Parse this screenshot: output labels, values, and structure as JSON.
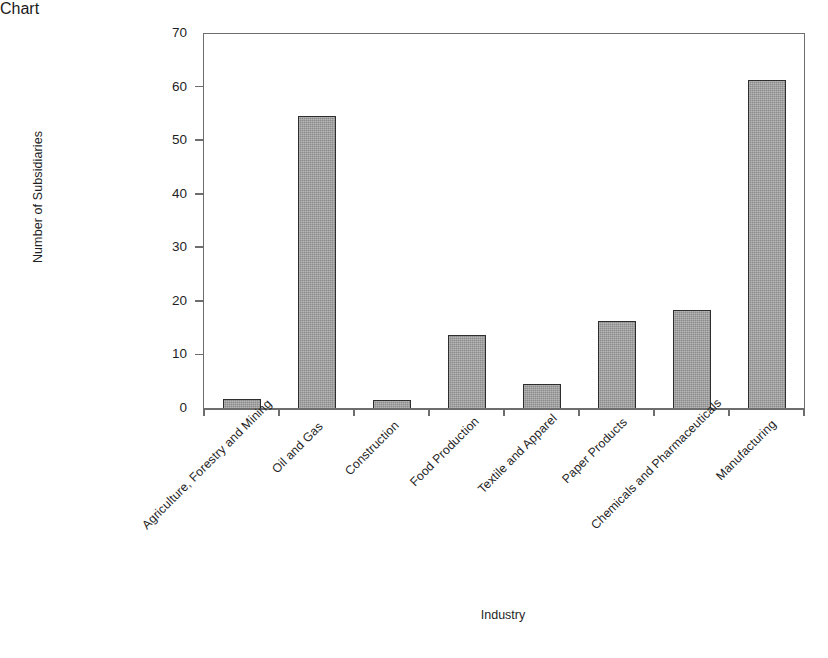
{
  "chart_data": {
    "type": "bar",
    "title": "",
    "xlabel": "Industry",
    "ylabel": "Number of Subsidiaries",
    "ylim": [
      0,
      70
    ],
    "ytick_labels": [
      "70",
      "60",
      "50",
      "40",
      "30",
      "20",
      "10",
      "0"
    ],
    "ytick_values": [
      70,
      60,
      50,
      40,
      30,
      20,
      10,
      0
    ],
    "grid": false,
    "legend": null,
    "bar_color": "#9c9c9c",
    "bar_edge_color": "#2e2e2e",
    "axis_color": "#6d6d6d",
    "categories": [
      "Agriculture, Forestry and Mining",
      "Oil and Gas",
      "Construction",
      "Food Production",
      "Textile and Apparel",
      "Paper Products",
      "Chemicals and Pharmaceuticals",
      "Manufacturing"
    ],
    "values": [
      1.9,
      54.7,
      1.7,
      13.8,
      4.7,
      16.5,
      18.5,
      61.4
    ]
  }
}
